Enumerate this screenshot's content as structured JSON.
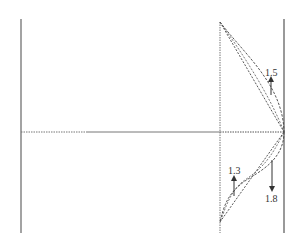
{
  "diagram": {
    "colors": {
      "background": "#ffffff",
      "line": "#555555",
      "dashed": "#444444",
      "label": "#333333"
    },
    "walls": [
      {
        "name": "left-wall",
        "style": "solid"
      },
      {
        "name": "right-wall",
        "style": "solid"
      }
    ],
    "axes": {
      "centerline": "horizontal line, dotted at left end, solid middle, dotted right segment",
      "reference_line": "vertical dotted line"
    },
    "profiles": [
      {
        "name": "upper-profile",
        "label": "1.5",
        "arrow": "up"
      },
      {
        "name": "lower-profile-left",
        "label": "1.3",
        "arrow": "up"
      },
      {
        "name": "lower-profile-right",
        "label": "1.8",
        "arrow": "down"
      }
    ],
    "labels": {
      "upper": "1.5",
      "lower_left": "1.3",
      "lower_right": "1.8"
    }
  }
}
